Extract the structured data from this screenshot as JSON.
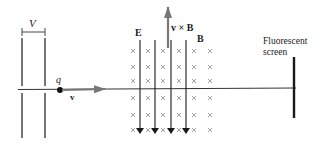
{
  "diagram": {
    "labels": {
      "voltage": "V",
      "charge": "q",
      "velocity": "v",
      "electric_field": "E",
      "force": "v × B",
      "magnetic_field": "B",
      "screen_line1": "Fluorescent",
      "screen_line2": "screen"
    },
    "colors": {
      "ink": "#1a1a1a",
      "arrow_gray": "#777777",
      "cross": "#8a8a8a",
      "beam": "#333333"
    },
    "field_lines_x": [
      140,
      155,
      171,
      186
    ],
    "cross_cols_x": [
      133,
      148,
      163,
      179,
      194,
      210
    ],
    "cross_rows_y": [
      51,
      67,
      81,
      98,
      115,
      130
    ]
  }
}
